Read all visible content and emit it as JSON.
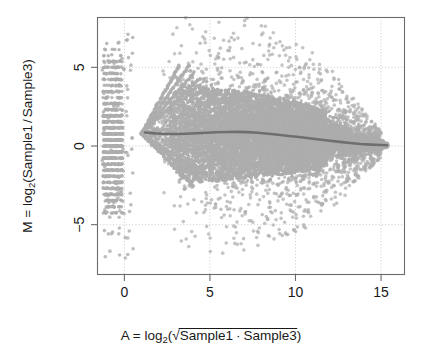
{
  "chart_data": {
    "type": "scatter",
    "title": "",
    "subtitle": "",
    "xlabel_parts": {
      "lead": "A = log",
      "base": "2",
      "open_paren": "(",
      "radicand_left": "Sample1",
      "radicand_dot": "·",
      "radicand_right": "Sample3",
      "close_paren": ")"
    },
    "xlabel": "A = log2( sqrt(Sample1 · Sample3) )",
    "ylabel_parts": {
      "lead": "M = log",
      "base": "2",
      "open_paren": "(",
      "numerator": "Sample1",
      "slash": "/",
      "denominator": "Sample3",
      "close_paren": ")"
    },
    "ylabel": "M = log2(Sample1 / Sample3)",
    "xlim": [
      -1.6,
      16.4
    ],
    "ylim": [
      -8.2,
      8.2
    ],
    "xticks": [
      0,
      5,
      10,
      15
    ],
    "xtick_labels": [
      "0",
      "5",
      "10",
      "15"
    ],
    "yticks": [
      -5,
      0,
      5
    ],
    "ytick_labels": [
      "−5",
      "0",
      "5"
    ],
    "grid": true,
    "grid_style": "dotted",
    "legend": "none",
    "point_color": "#adadad",
    "loess_color": "#6f6f6f",
    "grid_color": "#c9c9c9",
    "frame_color": "#6b6b6b",
    "n_points_approx": 20000,
    "loess_curve": [
      {
        "a": 1.2,
        "m": 0.86
      },
      {
        "a": 1.8,
        "m": 0.8
      },
      {
        "a": 2.4,
        "m": 0.76
      },
      {
        "a": 3.0,
        "m": 0.76
      },
      {
        "a": 3.6,
        "m": 0.78
      },
      {
        "a": 4.2,
        "m": 0.81
      },
      {
        "a": 4.8,
        "m": 0.84
      },
      {
        "a": 5.4,
        "m": 0.87
      },
      {
        "a": 6.0,
        "m": 0.89
      },
      {
        "a": 6.6,
        "m": 0.9
      },
      {
        "a": 7.2,
        "m": 0.88
      },
      {
        "a": 7.8,
        "m": 0.84
      },
      {
        "a": 8.4,
        "m": 0.78
      },
      {
        "a": 9.0,
        "m": 0.71
      },
      {
        "a": 9.6,
        "m": 0.64
      },
      {
        "a": 10.2,
        "m": 0.57
      },
      {
        "a": 10.8,
        "m": 0.49
      },
      {
        "a": 11.4,
        "m": 0.41
      },
      {
        "a": 12.0,
        "m": 0.33
      },
      {
        "a": 12.6,
        "m": 0.26
      },
      {
        "a": 13.2,
        "m": 0.19
      },
      {
        "a": 13.8,
        "m": 0.13
      },
      {
        "a": 14.4,
        "m": 0.09
      },
      {
        "a": 15.0,
        "m": 0.06
      },
      {
        "a": 15.35,
        "m": 0.05
      }
    ],
    "cloud_envelope_upper": [
      {
        "a": 1.0,
        "m": 0.9
      },
      {
        "a": 1.6,
        "m": 1.6
      },
      {
        "a": 2.2,
        "m": 2.6
      },
      {
        "a": 2.8,
        "m": 3.5
      },
      {
        "a": 3.4,
        "m": 4.2
      },
      {
        "a": 4.0,
        "m": 4.4
      },
      {
        "a": 4.6,
        "m": 4.1
      },
      {
        "a": 5.4,
        "m": 3.9
      },
      {
        "a": 6.2,
        "m": 3.8
      },
      {
        "a": 7.0,
        "m": 3.7
      },
      {
        "a": 8.0,
        "m": 3.5
      },
      {
        "a": 9.0,
        "m": 3.3
      },
      {
        "a": 10.0,
        "m": 3.0
      },
      {
        "a": 11.0,
        "m": 2.7
      },
      {
        "a": 12.0,
        "m": 2.3
      },
      {
        "a": 13.0,
        "m": 1.7
      },
      {
        "a": 14.0,
        "m": 1.0
      },
      {
        "a": 15.0,
        "m": 0.45
      },
      {
        "a": 15.35,
        "m": 0.2
      }
    ],
    "cloud_envelope_lower": [
      {
        "a": 1.0,
        "m": 0.6
      },
      {
        "a": 1.6,
        "m": 0.1
      },
      {
        "a": 2.2,
        "m": -0.7
      },
      {
        "a": 2.8,
        "m": -1.6
      },
      {
        "a": 3.4,
        "m": -2.3
      },
      {
        "a": 4.0,
        "m": -2.6
      },
      {
        "a": 4.6,
        "m": -2.6
      },
      {
        "a": 5.4,
        "m": -2.5
      },
      {
        "a": 6.2,
        "m": -2.4
      },
      {
        "a": 7.0,
        "m": -2.3
      },
      {
        "a": 8.0,
        "m": -2.2
      },
      {
        "a": 9.0,
        "m": -2.1
      },
      {
        "a": 10.0,
        "m": -1.9
      },
      {
        "a": 11.0,
        "m": -1.7
      },
      {
        "a": 12.0,
        "m": -1.4
      },
      {
        "a": 13.0,
        "m": -1.0
      },
      {
        "a": 14.0,
        "m": -0.6
      },
      {
        "a": 15.0,
        "m": -0.25
      },
      {
        "a": 15.35,
        "m": -0.1
      }
    ],
    "discrete_strip": {
      "a_range": [
        -1.25,
        -0.1
      ],
      "m_range": [
        -4.4,
        6.5
      ],
      "note": "vertical band of discrete low-count points left of A = 0"
    },
    "streak_rays": [
      {
        "origin_a": 1.0,
        "origin_m": 0.8,
        "slope": 1.95,
        "a_end": 3.2
      },
      {
        "origin_a": 1.0,
        "origin_m": 0.8,
        "slope": 1.55,
        "a_end": 3.8
      },
      {
        "origin_a": 1.0,
        "origin_m": 0.8,
        "slope": 1.25,
        "a_end": 4.1
      },
      {
        "origin_a": 1.0,
        "origin_m": 0.8,
        "slope": 1.02,
        "a_end": 4.4
      },
      {
        "origin_a": 1.0,
        "origin_m": 0.8,
        "slope": -1.1,
        "a_end": 4.0
      },
      {
        "origin_a": 1.0,
        "origin_m": 0.8,
        "slope": -0.88,
        "a_end": 4.4
      },
      {
        "origin_a": 1.0,
        "origin_m": 0.8,
        "slope": -0.72,
        "a_end": 4.8
      }
    ]
  },
  "plot": {
    "frame": {
      "left": 97,
      "top": 17,
      "right": 405,
      "bottom": 275
    },
    "device_size": {
      "width": 423,
      "height": 362
    }
  }
}
